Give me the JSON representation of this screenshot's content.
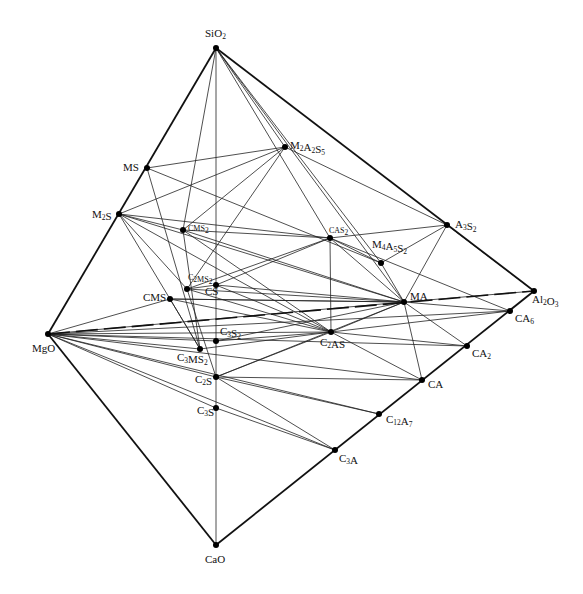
{
  "diagram": {
    "nodes": [
      {
        "id": "SiO2",
        "label": "SiO",
        "sub": "2",
        "x": 216,
        "y": 48,
        "lx": 205,
        "ly": 37
      },
      {
        "id": "MgO",
        "label": "MgO",
        "sub": "",
        "x": 48,
        "y": 334,
        "lx": 32,
        "ly": 352
      },
      {
        "id": "CaO",
        "label": "CaO",
        "sub": "",
        "x": 216,
        "y": 545,
        "lx": 205,
        "ly": 563
      },
      {
        "id": "Al2O3",
        "label": "Al",
        "sub": "2",
        "post": "O",
        "sub2": "3",
        "x": 534,
        "y": 291,
        "lx": 532,
        "ly": 303
      },
      {
        "id": "MS",
        "label": "MS",
        "sub": "",
        "x": 147,
        "y": 168,
        "lx": 123,
        "ly": 171
      },
      {
        "id": "M2S",
        "label": "M",
        "sub": "2",
        "post": "S",
        "x": 119,
        "y": 214,
        "lx": 92,
        "ly": 218
      },
      {
        "id": "M2A2S5",
        "label": "M",
        "sub": "2",
        "post": "A",
        "sub2": "2",
        "post2": "S",
        "sub3": "5",
        "x": 285,
        "y": 147,
        "lx": 290,
        "ly": 149
      },
      {
        "id": "A3S2",
        "label": "A",
        "sub": "3",
        "post": "S",
        "sub2": "2",
        "x": 447,
        "y": 225,
        "lx": 455,
        "ly": 228
      },
      {
        "id": "CMS2",
        "label": "CMS",
        "sub": "2",
        "x": 183,
        "y": 230,
        "lx": 188,
        "ly": 231,
        "small": true
      },
      {
        "id": "CAS2",
        "label": "CAS",
        "sub": "2",
        "x": 330,
        "y": 238,
        "lx": 329,
        "ly": 233,
        "small": true
      },
      {
        "id": "M4A5S2",
        "label": "M",
        "sub": "4",
        "post": "A",
        "sub2": "5",
        "post2": "S",
        "sub3": "2",
        "x": 381,
        "y": 263,
        "lx": 372,
        "ly": 248
      },
      {
        "id": "C2MS2",
        "label": "C",
        "sub": "2",
        "post": "MS",
        "sub2": "2",
        "x": 187,
        "y": 289,
        "lx": 188,
        "ly": 280,
        "small": true
      },
      {
        "id": "CS",
        "label": "CS",
        "sub": "",
        "x": 216,
        "y": 285,
        "lx": 205,
        "ly": 295
      },
      {
        "id": "CMS",
        "label": "CMS",
        "sub": "",
        "x": 170,
        "y": 299,
        "lx": 143,
        "ly": 301
      },
      {
        "id": "MA",
        "label": "MA",
        "sub": "",
        "x": 404,
        "y": 302,
        "lx": 410,
        "ly": 300
      },
      {
        "id": "CA6",
        "label": "CA",
        "sub": "6",
        "x": 510,
        "y": 311,
        "lx": 515,
        "ly": 322
      },
      {
        "id": "C3S2",
        "label": "C",
        "sub": "3",
        "post": "S",
        "sub2": "2",
        "x": 216,
        "y": 341,
        "lx": 220,
        "ly": 335
      },
      {
        "id": "C2AS",
        "label": "C",
        "sub": "2",
        "post": "AS",
        "x": 331,
        "y": 332,
        "lx": 320,
        "ly": 346
      },
      {
        "id": "CA2",
        "label": "CA",
        "sub": "2",
        "x": 467,
        "y": 346,
        "lx": 472,
        "ly": 357
      },
      {
        "id": "C3MS2",
        "label": "C",
        "sub": "3",
        "post": "MS",
        "sub2": "2",
        "x": 200,
        "y": 349,
        "lx": 177,
        "ly": 361
      },
      {
        "id": "C2S",
        "label": "C",
        "sub": "2",
        "post": "S",
        "x": 216,
        "y": 377,
        "lx": 195,
        "ly": 383
      },
      {
        "id": "CA",
        "label": "CA",
        "sub": "",
        "x": 422,
        "y": 380,
        "lx": 428,
        "ly": 388
      },
      {
        "id": "C3S",
        "label": "C",
        "sub": "3",
        "post": "S",
        "x": 216,
        "y": 408,
        "lx": 197,
        "ly": 414
      },
      {
        "id": "C12A7",
        "label": "C",
        "sub": "12",
        "post": "A",
        "sub2": "7",
        "x": 379,
        "y": 414,
        "lx": 386,
        "ly": 423
      },
      {
        "id": "C3A",
        "label": "C",
        "sub": "3",
        "post": "A",
        "x": 335,
        "y": 450,
        "lx": 339,
        "ly": 462
      }
    ],
    "edges_outer": [
      [
        "SiO2",
        "MgO"
      ],
      [
        "MgO",
        "CaO"
      ],
      [
        "CaO",
        "Al2O3"
      ],
      [
        "SiO2",
        "Al2O3"
      ]
    ],
    "edge_hidden_dashed": [
      [
        "MgO",
        "Al2O3"
      ]
    ],
    "edges_vertical": [
      [
        "SiO2",
        "CaO"
      ]
    ],
    "tie_lines": [
      [
        "SiO2",
        "M2A2S5"
      ],
      [
        "SiO2",
        "CAS2"
      ],
      [
        "SiO2",
        "M4A5S2"
      ],
      [
        "SiO2",
        "MA"
      ],
      [
        "SiO2",
        "CMS2"
      ],
      [
        "MS",
        "M2A2S5"
      ],
      [
        "MS",
        "M4A5S2"
      ],
      [
        "MS",
        "C3MS2"
      ],
      [
        "M2S",
        "CAS2"
      ],
      [
        "M2S",
        "M2A2S5"
      ],
      [
        "M2S",
        "MA"
      ],
      [
        "M2S",
        "C2MS2"
      ],
      [
        "M2S",
        "C3MS2"
      ],
      [
        "M2S",
        "C2AS"
      ],
      [
        "M2S",
        "CMS2"
      ],
      [
        "CMS2",
        "CAS2"
      ],
      [
        "CMS2",
        "MA"
      ],
      [
        "CMS2",
        "C2AS"
      ],
      [
        "M2A2S5",
        "A3S2"
      ],
      [
        "M2A2S5",
        "CMS2"
      ],
      [
        "M2A2S5",
        "C2MS2"
      ],
      [
        "CAS2",
        "A3S2"
      ],
      [
        "CAS2",
        "M4A5S2"
      ],
      [
        "CAS2",
        "C2MS2"
      ],
      [
        "CAS2",
        "CS"
      ],
      [
        "CAS2",
        "C2AS"
      ],
      [
        "CAS2",
        "MA"
      ],
      [
        "CAS2",
        "CA6"
      ],
      [
        "A3S2",
        "M4A5S2"
      ],
      [
        "A3S2",
        "MA"
      ],
      [
        "A3S2",
        "Al2O3"
      ],
      [
        "M4A5S2",
        "MA"
      ],
      [
        "MA",
        "Al2O3"
      ],
      [
        "MA",
        "CA6"
      ],
      [
        "MA",
        "CA2"
      ],
      [
        "MA",
        "CA"
      ],
      [
        "MA",
        "C2AS"
      ],
      [
        "MA",
        "CS"
      ],
      [
        "MA",
        "CMS"
      ],
      [
        "MA",
        "C2MS2"
      ],
      [
        "CMS",
        "C2AS"
      ],
      [
        "CMS",
        "MA"
      ],
      [
        "C2MS2",
        "C2AS"
      ],
      [
        "C2MS2",
        "CS"
      ],
      [
        "C2MS2",
        "C2S"
      ],
      [
        "CS",
        "C2AS"
      ],
      [
        "C3S2",
        "C2AS"
      ],
      [
        "C3S2",
        "MA"
      ],
      [
        "C2AS",
        "CA6"
      ],
      [
        "C2AS",
        "CA2"
      ],
      [
        "C2AS",
        "CA"
      ],
      [
        "C2AS",
        "C2S"
      ],
      [
        "C2AS",
        "C3MS2"
      ],
      [
        "C2S",
        "CA"
      ],
      [
        "C2S",
        "C12A7"
      ],
      [
        "C2S",
        "C3A"
      ],
      [
        "C2S",
        "MA"
      ],
      [
        "C3S",
        "C3A"
      ],
      [
        "MgO",
        "CMS"
      ],
      [
        "MgO",
        "C3MS2"
      ],
      [
        "MgO",
        "C2S"
      ],
      [
        "MgO",
        "C3S"
      ],
      [
        "MgO",
        "C2AS"
      ],
      [
        "MgO",
        "CA"
      ],
      [
        "MgO",
        "C12A7"
      ],
      [
        "MgO",
        "C3A"
      ],
      [
        "MgO",
        "MA"
      ],
      [
        "MgO",
        "C3S2"
      ],
      [
        "MgO",
        "CA2"
      ],
      [
        "MgO",
        "CA6"
      ],
      [
        "CMS",
        "C3MS2"
      ],
      [
        "CMS2",
        "C3MS2"
      ]
    ]
  }
}
